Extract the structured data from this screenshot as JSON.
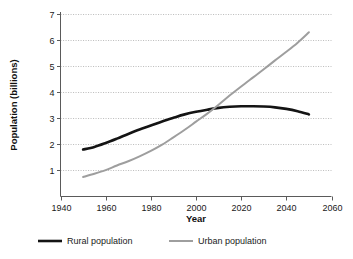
{
  "chart_data": {
    "type": "line",
    "title": "",
    "xlabel": "Year",
    "ylabel": "Population (billions)",
    "xlim": [
      1940,
      2060
    ],
    "ylim": [
      0,
      7
    ],
    "xticks": [
      1940,
      1960,
      1980,
      2000,
      2020,
      2040,
      2060
    ],
    "xtick_labels": [
      "1940",
      "1960",
      "1980",
      "2000",
      "2020",
      "2040",
      "2060"
    ],
    "yticks": [
      1,
      2,
      3,
      4,
      5,
      6,
      7
    ],
    "ytick_labels": [
      "1",
      "2",
      "3",
      "4",
      "5",
      "6",
      "7"
    ],
    "grid": "horizontal-dotted",
    "legend_position": "bottom",
    "x": [
      1950,
      1955,
      1960,
      1965,
      1970,
      1975,
      1980,
      1985,
      1990,
      1995,
      2000,
      2005,
      2010,
      2015,
      2020,
      2025,
      2030,
      2035,
      2040,
      2045,
      2050
    ],
    "series": [
      {
        "name": "Rural population",
        "color": "#141414",
        "width": 2.6,
        "values": [
          1.8,
          1.9,
          2.05,
          2.22,
          2.4,
          2.57,
          2.72,
          2.88,
          3.02,
          3.15,
          3.25,
          3.33,
          3.4,
          3.44,
          3.46,
          3.46,
          3.45,
          3.42,
          3.36,
          3.27,
          3.15
        ]
      },
      {
        "name": "Urban population",
        "color": "#9e9e9e",
        "width": 2.0,
        "values": [
          0.75,
          0.87,
          1.01,
          1.19,
          1.35,
          1.54,
          1.75,
          1.99,
          2.27,
          2.56,
          2.87,
          3.18,
          3.52,
          3.88,
          4.22,
          4.55,
          4.88,
          5.22,
          5.55,
          5.9,
          6.3
        ]
      }
    ],
    "legend": [
      {
        "label": "Rural population",
        "color": "#141414",
        "width": 2.6
      },
      {
        "label": "Urban population",
        "color": "#9e9e9e",
        "width": 2.0
      }
    ],
    "notes": {
      "crossover_year": 2006,
      "crossover_value": 3.35
    }
  }
}
